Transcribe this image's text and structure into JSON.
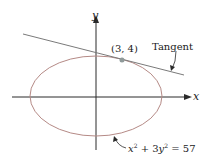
{
  "figure": {
    "axes": {
      "x_label": "x",
      "y_label": "y"
    },
    "point_label": "(3, 4)",
    "tangent_label": "Tangent",
    "equation": {
      "x_term": "x",
      "x_exp": "2",
      "plus": " + 3",
      "y_term": "y",
      "y_exp": "2",
      "rhs": " = 57"
    },
    "colors": {
      "ellipse": "#b58a86",
      "tangent": "#7a7a7a",
      "axis": "#2a2a2a",
      "point": "#8f9a9a"
    }
  }
}
